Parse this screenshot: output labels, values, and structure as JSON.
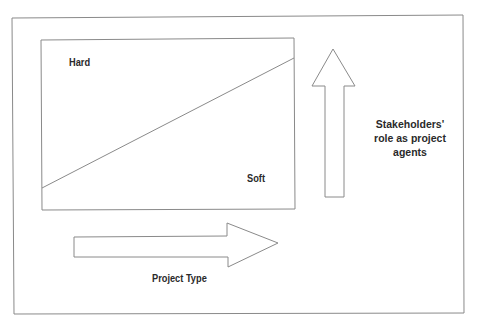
{
  "diagram": {
    "labels": {
      "hard": "Hard",
      "soft": "Soft",
      "project_type": "Project Type",
      "stakeholders_line1": "Stakeholders'",
      "stakeholders_line2": "role as project",
      "stakeholders_line3": "agents"
    },
    "colors": {
      "stroke": "#8a8a8a",
      "text": "#2a2a2a",
      "background": "#ffffff"
    }
  }
}
